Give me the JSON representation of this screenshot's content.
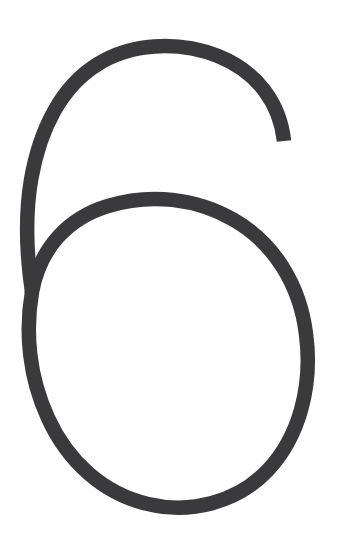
{
  "page": {
    "kind": "single-character-image",
    "canvas": {
      "width": 347,
      "height": 535,
      "background_color": "#ffffff"
    }
  },
  "glyph": {
    "character": "6",
    "name": "digit-six",
    "description": "A large handwritten-style numeral six drawn as a single thin open stroke: a long sweeping arc descending from upper right to lower left, joining a large oval bowl.",
    "style": "thin monoline, rounded, geometric",
    "stroke": {
      "color": "#3a3a3c",
      "width_px": 14.5,
      "linecap": "butt",
      "linejoin": "round",
      "fill": "none"
    },
    "metrics": {
      "top_y": 45,
      "bottom_y": 505,
      "left_x": 22,
      "right_x": 307,
      "cusp_x": 32,
      "cusp_y": 292,
      "terminal_x": 284,
      "terminal_y": 141,
      "bowl_top_y": 205,
      "bowl_bottom_y": 505,
      "bowl_left_x": 22,
      "bowl_right_x": 307
    },
    "paths": {
      "spine": "M 284 141 C 280 104 258 72 218 56 C 176 40 130 44 98 64 C 62 86 40 128 31 180 C 25 216 27 258 32 292",
      "bowl": "M 32 292 C 40 248 68 218 108 206 C 150 193 196 198 234 220 C 274 243 300 285 306 334 C 313 386 299 437 268 470 C 237 503 190 514 148 504 C 104 494 68 462 48 418 C 29 377 25 332 32 292"
    }
  }
}
